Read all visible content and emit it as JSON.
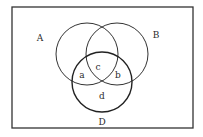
{
  "diagram": {
    "type": "venn",
    "universe": {
      "label": "D",
      "x": 12,
      "y": 7,
      "width": 181,
      "height": 121
    },
    "sets": [
      {
        "name": "left-circle",
        "label": "A",
        "cx": 87,
        "cy": 54,
        "r": 31,
        "label_x": 40,
        "label_y": 38
      },
      {
        "name": "right-circle",
        "label": "B",
        "cx": 117,
        "cy": 54,
        "r": 31,
        "label_x": 156,
        "label_y": 35
      },
      {
        "name": "lower-circle",
        "label": "",
        "cx": 102,
        "cy": 82,
        "r": 30
      }
    ],
    "regions": [
      {
        "label": "a",
        "x": 82,
        "y": 75
      },
      {
        "label": "b",
        "x": 118,
        "y": 75
      },
      {
        "label": "c",
        "x": 98,
        "y": 67
      },
      {
        "label": "d",
        "x": 102,
        "y": 96
      }
    ],
    "universe_label_position": {
      "x": 102,
      "y": 122
    },
    "colors": {
      "background": "#ffffff",
      "stroke": "#333333",
      "text": "#2a2a2a"
    }
  }
}
